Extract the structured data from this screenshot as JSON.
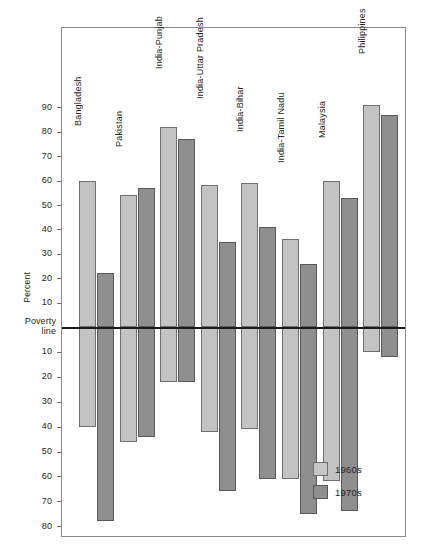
{
  "chart_data": {
    "type": "bar",
    "title": "",
    "xlabel": "",
    "ylabel": "Percent",
    "orientation": "vertical",
    "grid": false,
    "legend_position": "bottom-right",
    "baseline_label": "Poverty line",
    "baseline_note": "Bars above the line show the percent of population above the poverty line; bars below the line show the percent below it.",
    "axis_up_ticks": [
      10,
      20,
      30,
      40,
      50,
      60,
      70,
      80,
      90
    ],
    "axis_down_ticks": [
      10,
      20,
      30,
      40,
      50,
      60,
      70,
      80
    ],
    "ylim_up": 97,
    "ylim_down": 82,
    "categories": [
      "Bangladesh",
      "Pakistan",
      "India-Punjab",
      "India-Uttar Pradesh",
      "India-Bihar",
      "India-Tamil Nadu",
      "Malaysia",
      "Philippines"
    ],
    "series": [
      {
        "name": "1960s",
        "color": "#c3c3c3",
        "above": [
          60,
          54,
          82,
          58,
          59,
          36,
          60,
          91
        ],
        "below": [
          40,
          46,
          22,
          42,
          41,
          61,
          62,
          10
        ]
      },
      {
        "name": "1970s",
        "color": "#8f8f8f",
        "above": [
          22,
          57,
          77,
          35,
          41,
          26,
          53,
          87
        ],
        "below": [
          78,
          44,
          22,
          66,
          61,
          75,
          74,
          12
        ]
      }
    ]
  },
  "legend": {
    "items": [
      {
        "label": "1960s",
        "key": "s60"
      },
      {
        "label": "1970s",
        "key": "s70"
      }
    ]
  },
  "axis": {
    "y_label": "Percent",
    "poverty_line_1": "Poverty",
    "poverty_line_2": "line"
  }
}
